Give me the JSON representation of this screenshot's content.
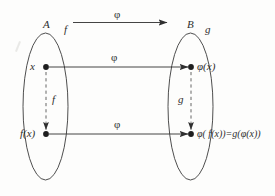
{
  "figure": {
    "type": "commutative-diagram",
    "sets": {
      "domain_label": "A",
      "codomain_label": "B"
    },
    "maps": {
      "top_arrow_label": "φ",
      "upper_arrow_label": "φ",
      "lower_arrow_label": "φ",
      "domain_self_map_top": "f",
      "codomain_self_map_top": "g",
      "domain_self_map_vertical": "f",
      "codomain_self_map_vertical": "g"
    },
    "elements": {
      "domain_point_upper": "x",
      "domain_point_lower": "f(x)",
      "codomain_point_upper": "φ(x)",
      "codomain_point_lower": "φ( f(x))=g(φ(x))"
    },
    "colors": {
      "ink": "#2f2f2f",
      "stroke": "#3a3a3a",
      "dashed_stroke": "#555555",
      "background": "#fdfdfc"
    }
  }
}
